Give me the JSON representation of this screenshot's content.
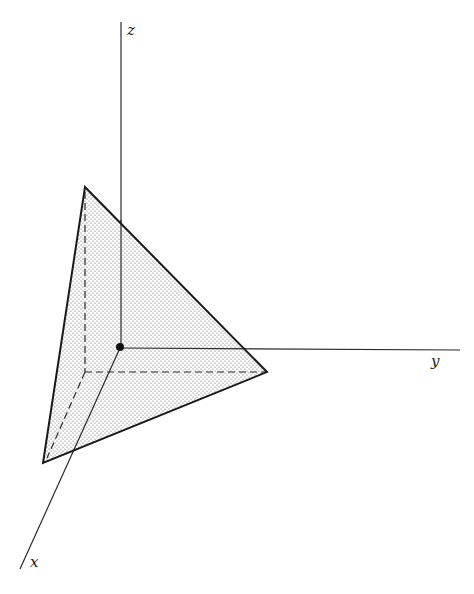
{
  "diagram": {
    "type": "3d-coordinate-axes-with-plane-triangle",
    "axes": {
      "x": {
        "label": "x"
      },
      "y": {
        "label": "y"
      },
      "z": {
        "label": "z"
      }
    },
    "shape": {
      "description": "Stippled triangular plane intersecting x, y, z axes with dashed hidden edges",
      "fill": "stippled",
      "stroke_color": "#1a1a1a"
    },
    "origin_marker": "filled-dot"
  }
}
